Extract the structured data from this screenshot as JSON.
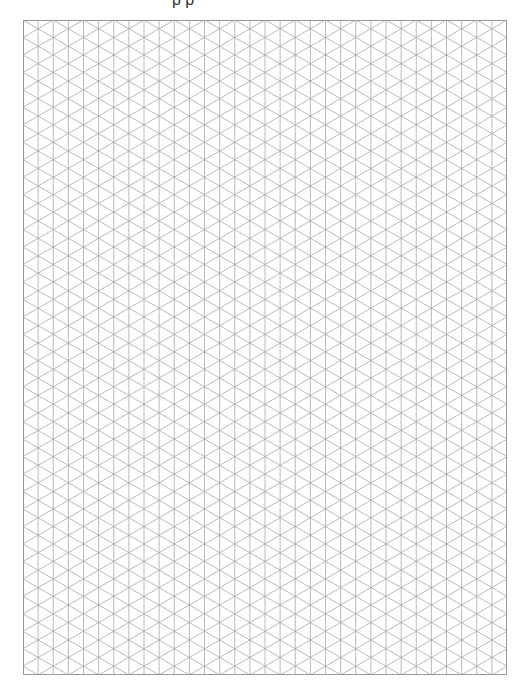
{
  "page": {
    "title_fragment": "p p",
    "grid": {
      "type": "isometric",
      "x": 23,
      "y": 20,
      "width": 484,
      "height": 655,
      "columns": 32,
      "line_color": "#a8a8a8",
      "border_color": "#999999",
      "background": "#ffffff"
    }
  }
}
